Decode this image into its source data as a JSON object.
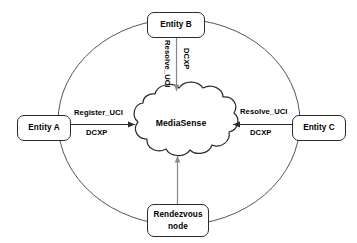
{
  "diagram": {
    "colors": {
      "stroke": "#2b2b2b",
      "ellipse_stroke": "#555555",
      "text": "#000000",
      "background": "#ffffff"
    },
    "cloud": {
      "label": "MediaSense"
    },
    "nodes": [
      {
        "id": "entity-a",
        "label": "Entity A",
        "shape": "rounded-rect"
      },
      {
        "id": "entity-b",
        "label": "Entity B",
        "shape": "rounded-rect"
      },
      {
        "id": "entity-c",
        "label": "Entity C",
        "shape": "rounded-rect"
      },
      {
        "id": "rendezvous",
        "label_line1": "Rendezvous",
        "label_line2": "node",
        "shape": "rounded-rect"
      }
    ],
    "edges": [
      {
        "id": "a-to-cloud",
        "from": "entity-a",
        "to": "cloud",
        "direction": "right",
        "primary_label": "Register_UCI",
        "secondary_label": "DCXP"
      },
      {
        "id": "b-to-cloud",
        "from": "entity-b",
        "to": "cloud",
        "direction": "down",
        "primary_label": "Resolve_UCI",
        "secondary_label": "DCXP"
      },
      {
        "id": "c-to-cloud",
        "from": "entity-c",
        "to": "cloud",
        "direction": "left",
        "primary_label": "Resolve_UCI",
        "secondary_label": "DCXP"
      },
      {
        "id": "rendezvous-to-cloud",
        "from": "rendezvous",
        "to": "cloud",
        "direction": "up",
        "primary_label": "",
        "secondary_label": ""
      }
    ],
    "boundary": {
      "shape": "ellipse",
      "label": ""
    }
  }
}
